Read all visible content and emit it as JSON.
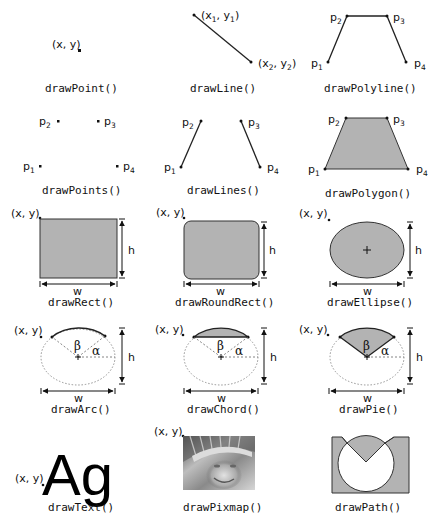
{
  "colors": {
    "fill": "#b3b3b3",
    "stroke": "#333333",
    "ink": "#111111",
    "dotted": "#777777"
  },
  "labels": {
    "xy": "(x, y)",
    "x1y1": "(x1, y1)",
    "x2y2": "(x2, y2)",
    "p1": "p1",
    "p2": "p2",
    "p3": "p3",
    "p4": "p4",
    "w": "w",
    "h": "h",
    "alpha": "α",
    "beta": "β",
    "text_sample": "Ag"
  },
  "functions": [
    {
      "id": "point",
      "name": "drawPoint()"
    },
    {
      "id": "line",
      "name": "drawLine()"
    },
    {
      "id": "polyline",
      "name": "drawPolyline()"
    },
    {
      "id": "points",
      "name": "drawPoints()"
    },
    {
      "id": "lines",
      "name": "drawLines()"
    },
    {
      "id": "polygon",
      "name": "drawPolygon()"
    },
    {
      "id": "rect",
      "name": "drawRect()"
    },
    {
      "id": "roundrect",
      "name": "drawRoundRect()"
    },
    {
      "id": "ellipse",
      "name": "drawEllipse()"
    },
    {
      "id": "arc",
      "name": "drawArc()"
    },
    {
      "id": "chord",
      "name": "drawChord()"
    },
    {
      "id": "pie",
      "name": "drawPie()"
    },
    {
      "id": "text",
      "name": "drawText()"
    },
    {
      "id": "pixmap",
      "name": "drawPixmap()"
    },
    {
      "id": "path",
      "name": "drawPath()"
    }
  ]
}
